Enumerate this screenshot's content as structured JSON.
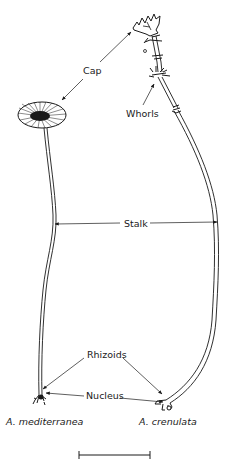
{
  "figure": {
    "labels": {
      "cap": "Cap",
      "whorls": "Whorls",
      "stalk": "Stalk",
      "rhizoids": "Rhizoids",
      "nucleus": "Nucleus"
    },
    "species": {
      "left": "A. mediterranea",
      "right": "A. crenulata"
    },
    "scale_bar": {
      "label": ""
    },
    "colors": {
      "ink": "#1a1a1a",
      "background": "#ffffff"
    }
  }
}
